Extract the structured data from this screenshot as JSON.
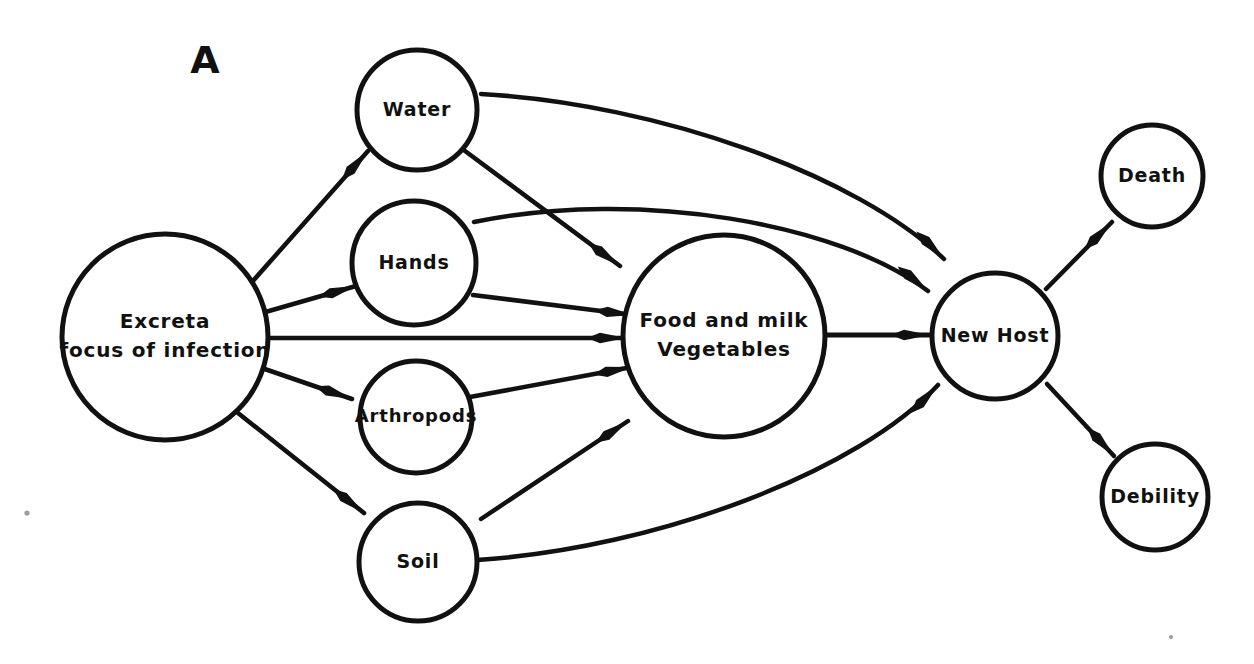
{
  "figure": {
    "panel_label": "A",
    "background_color": "#ffffff",
    "ink_color": "#111111",
    "width": 1254,
    "height": 664
  },
  "nodes": [
    {
      "id": "excreta",
      "label_lines": [
        "Excreta",
        "focus of infection"
      ],
      "cx": 165,
      "cy": 337,
      "r": 103,
      "font_size": 20,
      "stroke_width": 5
    },
    {
      "id": "water",
      "label_lines": [
        "Water"
      ],
      "cx": 417,
      "cy": 110,
      "r": 60,
      "font_size": 19,
      "stroke_width": 5
    },
    {
      "id": "hands",
      "label_lines": [
        "Hands"
      ],
      "cx": 414,
      "cy": 263,
      "r": 62,
      "font_size": 19,
      "stroke_width": 5
    },
    {
      "id": "arthropods",
      "label_lines": [
        "Arthropods"
      ],
      "cx": 416,
      "cy": 417,
      "r": 56,
      "font_size": 18,
      "stroke_width": 5
    },
    {
      "id": "soil",
      "label_lines": [
        "Soil"
      ],
      "cx": 418,
      "cy": 562,
      "r": 59,
      "font_size": 19,
      "stroke_width": 5
    },
    {
      "id": "food",
      "label_lines": [
        "Food and milk",
        "Vegetables"
      ],
      "cx": 724,
      "cy": 336,
      "r": 101,
      "font_size": 20,
      "stroke_width": 5
    },
    {
      "id": "newhost",
      "label_lines": [
        "New Host"
      ],
      "cx": 995,
      "cy": 336,
      "r": 63,
      "font_size": 19,
      "stroke_width": 5
    },
    {
      "id": "death",
      "label_lines": [
        "Death"
      ],
      "cx": 1152,
      "cy": 176,
      "r": 51,
      "font_size": 19,
      "stroke_width": 5
    },
    {
      "id": "debility",
      "label_lines": [
        "Debility"
      ],
      "cx": 1155,
      "cy": 497,
      "r": 53,
      "font_size": 19,
      "stroke_width": 5
    }
  ],
  "edges": [
    {
      "id": "excreta-to-water",
      "from": "excreta",
      "to": "water",
      "path": "M 252 282 L 368 151",
      "arrow_at": [
        368,
        151
      ],
      "arrow_angle": -48,
      "stroke_width": 4.5
    },
    {
      "id": "excreta-to-hands",
      "from": "excreta",
      "to": "hands",
      "path": "M 262 313 L 356 286",
      "arrow_at": [
        356,
        286
      ],
      "arrow_angle": -16,
      "stroke_width": 4.5
    },
    {
      "id": "excreta-to-food",
      "from": "excreta",
      "to": "food",
      "path": "M 262 338 L 626 338",
      "arrow_at": [
        626,
        338
      ],
      "arrow_angle": 0,
      "stroke_width": 4.5
    },
    {
      "id": "excreta-to-arthropods",
      "from": "excreta",
      "to": "arthropods",
      "path": "M 256 366 L 352 399",
      "arrow_at": [
        352,
        399
      ],
      "arrow_angle": 19,
      "stroke_width": 4.5
    },
    {
      "id": "excreta-to-soil",
      "from": "excreta",
      "to": "soil",
      "path": "M 238 413 L 364 513",
      "arrow_at": [
        364,
        513
      ],
      "arrow_angle": 38,
      "stroke_width": 4.5
    },
    {
      "id": "water-to-food",
      "from": "water",
      "to": "food",
      "path": "M 461 148 L 620 266",
      "arrow_at": [
        620,
        266
      ],
      "arrow_angle": 36,
      "stroke_width": 4.5
    },
    {
      "id": "water-to-newhost",
      "from": "water",
      "to": "newhost",
      "path": "M 481 94 C 660 104 858 176 944 259",
      "arrow_at": [
        944,
        259
      ],
      "arrow_angle": 45,
      "stroke_width": 4.5
    },
    {
      "id": "hands-to-food",
      "from": "hands",
      "to": "food",
      "path": "M 473 295 L 633 315",
      "arrow_at": [
        633,
        315
      ],
      "arrow_angle": 7,
      "stroke_width": 4.5
    },
    {
      "id": "hands-to-newhost",
      "from": "hands",
      "to": "newhost",
      "path": "M 474 222 C 640 188 840 224 928 291",
      "arrow_at": [
        928,
        291
      ],
      "arrow_angle": 39,
      "stroke_width": 4.5
    },
    {
      "id": "arthropods-to-food",
      "from": "arthropods",
      "to": "food",
      "path": "M 470 397 L 632 367",
      "arrow_at": [
        632,
        367
      ],
      "arrow_angle": -11,
      "stroke_width": 4.5
    },
    {
      "id": "soil-to-food",
      "from": "soil",
      "to": "food",
      "path": "M 481 519 L 628 421",
      "arrow_at": [
        628,
        421
      ],
      "arrow_angle": -34,
      "stroke_width": 4.5
    },
    {
      "id": "soil-to-newhost",
      "from": "soil",
      "to": "newhost",
      "path": "M 477 560 C 660 548 860 470 938 385",
      "arrow_at": [
        938,
        385
      ],
      "arrow_angle": -46,
      "stroke_width": 4.5
    },
    {
      "id": "food-to-newhost",
      "from": "food",
      "to": "newhost",
      "path": "M 828 335 L 930 335",
      "arrow_at": [
        930,
        335
      ],
      "arrow_angle": 0,
      "stroke_width": 5
    },
    {
      "id": "newhost-to-death",
      "from": "newhost",
      "to": "death",
      "path": "M 1046 289 L 1112 222",
      "arrow_at": [
        1112,
        222
      ],
      "arrow_angle": -45,
      "stroke_width": 4.5
    },
    {
      "id": "newhost-to-debility",
      "from": "newhost",
      "to": "debility",
      "path": "M 1047 384 L 1114 456",
      "arrow_at": [
        1114,
        456
      ],
      "arrow_angle": 47,
      "stroke_width": 4.5
    }
  ],
  "specks": [
    {
      "cx": 27,
      "cy": 513,
      "r": 2.6
    },
    {
      "cx": 1171,
      "cy": 637,
      "r": 2.0
    }
  ]
}
